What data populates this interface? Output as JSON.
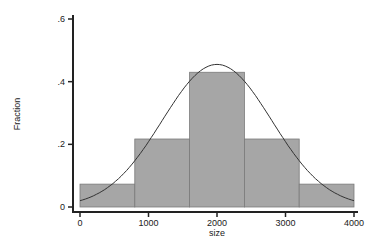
{
  "chart_data": {
    "type": "bar",
    "title": "",
    "xlabel": "size",
    "ylabel": "Fraction",
    "bins": [
      [
        0,
        800
      ],
      [
        800,
        1600
      ],
      [
        1600,
        2400
      ],
      [
        2400,
        3200
      ],
      [
        3200,
        4000
      ]
    ],
    "categories": [
      "0-800",
      "800-1600",
      "1600-2400",
      "2400-3200",
      "3200-4000"
    ],
    "values": [
      0.073,
      0.217,
      0.43,
      0.217,
      0.073
    ],
    "overlay": {
      "type": "normal-density",
      "mean": 2000,
      "peak": 0.455
    },
    "xticks": [
      "0",
      "1000",
      "2000",
      "3000",
      "4000"
    ],
    "xtick_values": [
      0,
      1000,
      2000,
      3000,
      4000
    ],
    "yticks": [
      "0",
      ".2",
      ".4",
      ".6"
    ],
    "ytick_values": [
      0,
      0.2,
      0.4,
      0.6
    ],
    "xlim": [
      0,
      4000
    ],
    "ylim": [
      0,
      0.6
    ],
    "grid": false,
    "colors": {
      "bar": "#a6a6a6",
      "bar_edge": "#7a7a7a",
      "curve": "#333333"
    }
  }
}
